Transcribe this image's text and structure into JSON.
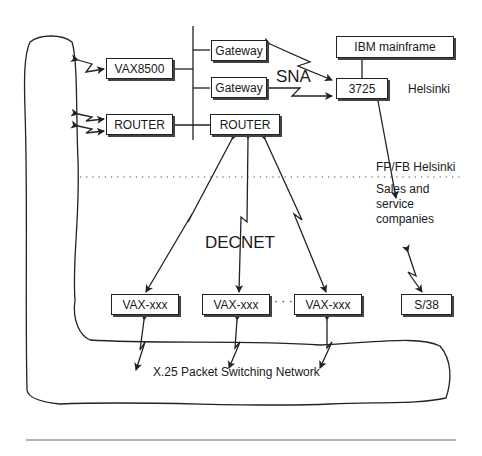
{
  "nodes": {
    "vax8500": "VAX8500",
    "router_left": "ROUTER",
    "gateway_top": "Gateway",
    "gateway_bottom": "Gateway",
    "router_center": "ROUTER",
    "ibm_mainframe": "IBM mainframe",
    "fep_3725": "3725",
    "vax_1": "VAX-xxx",
    "vax_2": "VAX-xxx",
    "vax_3": "VAX-xxx",
    "s38": "S/38"
  },
  "labels": {
    "sna": "SNA",
    "helsinki": "Helsinki",
    "fpfb_helsinki": "FP/FB Helsinki",
    "sales_service": "Sales and\nservice\ncompanies",
    "decnet": "DECNET",
    "x25": "X.25 Packet Switching Network",
    "ellipsis": "· · ·"
  },
  "colors": {
    "line": "#222222",
    "background": "#ffffff"
  }
}
